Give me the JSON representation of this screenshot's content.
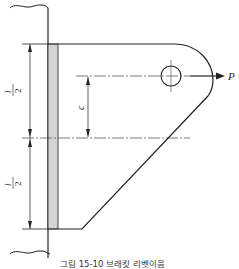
{
  "figure": {
    "caption": "그림 15-10  브래킷 리벳이음",
    "labels": {
      "half_length_top_num": "l",
      "half_length_top_den": "2",
      "half_length_bottom_num": "l",
      "half_length_bottom_den": "2",
      "offset": "c",
      "force": "P"
    },
    "colors": {
      "line": "#222222",
      "plate_fill": "#d4d4d4",
      "centerline": "#444444"
    }
  }
}
